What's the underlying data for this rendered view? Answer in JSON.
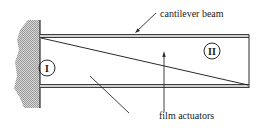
{
  "diagram": {
    "labels": {
      "beam": "cantilever beam",
      "actuators": "film actuators",
      "region_1": "I",
      "region_2": "II"
    },
    "colors": {
      "line": "#2a2a2a",
      "wall_fill": "#b8b8b8",
      "beam_gap": "#d0d0d0"
    }
  }
}
